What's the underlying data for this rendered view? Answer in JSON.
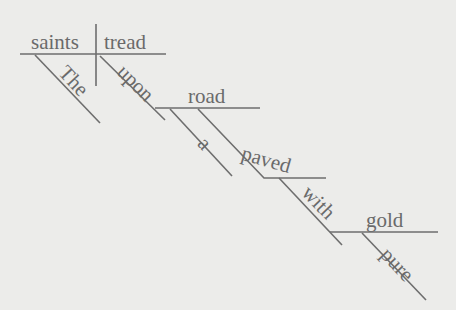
{
  "diagram": {
    "type": "sentence-diagram",
    "sentence": "The saints tread upon a road paved with pure gold",
    "words": {
      "subject": "saints",
      "verb": "tread",
      "subject_modifier": "The",
      "preposition_1": "upon",
      "object_1": "road",
      "object_1_modifier": "a",
      "participle": "paved",
      "preposition_2": "with",
      "object_2": "gold",
      "object_2_modifier": "pure"
    },
    "colors": {
      "background": "#ececea",
      "ink": "#6e6e6e"
    }
  }
}
